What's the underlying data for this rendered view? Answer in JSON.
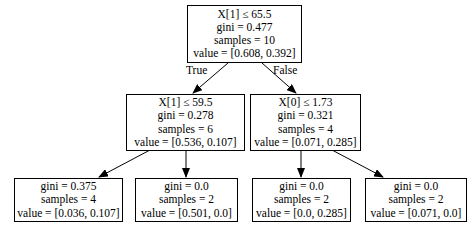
{
  "tree": {
    "root": {
      "condition": "X[1] ≤ 65.5",
      "gini": "gini = 0.477",
      "samples": "samples = 10",
      "value": "value = [0.608, 0.392]"
    },
    "edge_labels": {
      "true": "True",
      "false": "False"
    },
    "left": {
      "condition": "X[1] ≤ 59.5",
      "gini": "gini = 0.278",
      "samples": "samples = 6",
      "value": "value = [0.536, 0.107]"
    },
    "right": {
      "condition": "X[0] ≤ 1.73",
      "gini": "gini = 0.321",
      "samples": "samples = 4",
      "value": "value = [0.071, 0.285]"
    },
    "leaves": [
      {
        "gini": "gini = 0.375",
        "samples": "samples = 4",
        "value": "value = [0.036, 0.107]"
      },
      {
        "gini": "gini = 0.0",
        "samples": "samples = 2",
        "value": "value = [0.501, 0.0]"
      },
      {
        "gini": "gini = 0.0",
        "samples": "samples = 2",
        "value": "value = [0.0, 0.285]"
      },
      {
        "gini": "gini = 0.0",
        "samples": "samples = 2",
        "value": "value = [0.071, 0.0]"
      }
    ]
  }
}
